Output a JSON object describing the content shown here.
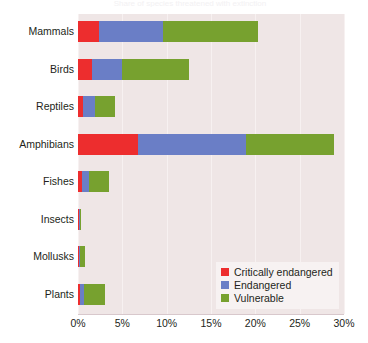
{
  "title_strip": "Share of species threatened with extinction",
  "chart_data": {
    "type": "bar",
    "orientation": "horizontal",
    "stacked": true,
    "title": "",
    "xlabel": "",
    "ylabel": "",
    "xlim": [
      0,
      30
    ],
    "grid": true,
    "legend_position": "bottom-right",
    "categories": [
      "Mammals",
      "Birds",
      "Reptiles",
      "Amphibians",
      "Fishes",
      "Insects",
      "Mollusks",
      "Plants"
    ],
    "xticks": [
      "0%",
      "5%",
      "10%",
      "15%",
      "20%",
      "25%",
      "30%"
    ],
    "xtick_values": [
      0,
      5,
      10,
      15,
      20,
      25,
      30
    ],
    "series": [
      {
        "name": "Critically endangered",
        "color": "#ed2d2e",
        "values": [
          2.4,
          1.6,
          0.6,
          6.8,
          0.4,
          0.05,
          0.15,
          0.2
        ]
      },
      {
        "name": "Endangered",
        "color": "#6a7ec6",
        "values": [
          7.2,
          3.4,
          1.3,
          12.1,
          0.8,
          0.03,
          0.05,
          0.45
        ]
      },
      {
        "name": "Vulnerable",
        "color": "#77a12f",
        "values": [
          10.7,
          7.5,
          2.3,
          10.0,
          2.3,
          0.02,
          0.6,
          2.35
        ]
      }
    ],
    "totals": [
      20.3,
      12.5,
      4.2,
      28.9,
      3.5,
      0.1,
      0.8,
      3.0
    ],
    "plot_background": "#efe6e6",
    "gridline_color": "#f7f1f1"
  },
  "legend": {
    "items": [
      {
        "label": "Critically endangered",
        "color": "#ed2d2e"
      },
      {
        "label": "Endangered",
        "color": "#6a7ec6"
      },
      {
        "label": "Vulnerable",
        "color": "#77a12f"
      }
    ]
  }
}
